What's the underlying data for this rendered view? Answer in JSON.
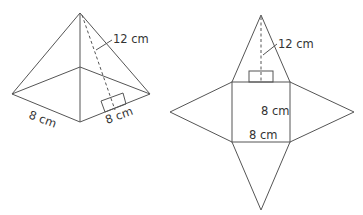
{
  "pyramid": {
    "slant_height_label": "12 cm",
    "base_left_label": "8 cm",
    "base_right_label": "8 cm"
  },
  "net": {
    "slant_height_label": "12 cm",
    "square_side_label": "8 cm",
    "square_bottom_label": "8 cm"
  }
}
